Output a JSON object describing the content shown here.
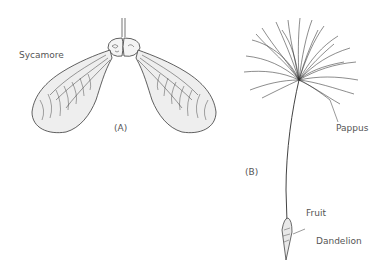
{
  "figure": {
    "panel_a": {
      "panel_label": "(A)",
      "species": "Sycamore"
    },
    "panel_b": {
      "panel_label": "(B)",
      "species": "Dandelion",
      "parts": {
        "pappus": "Pappus",
        "fruit": "Fruit"
      }
    },
    "colors": {
      "ink": "#3a3a3a",
      "label": "#555555",
      "background": "#ffffff"
    }
  }
}
